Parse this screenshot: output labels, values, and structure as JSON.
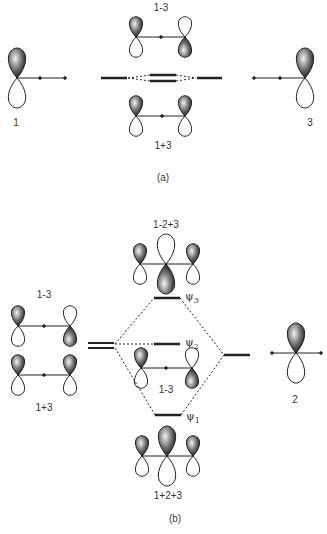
{
  "diagram": {
    "type": "molecular-orbital-interaction",
    "part_a": {
      "caption": "(a)",
      "left_fragment_label": "1",
      "right_fragment_label": "3",
      "upper_combination_label": "1-3",
      "lower_combination_label": "1+3"
    },
    "part_b": {
      "caption": "(b)",
      "left_upper_label": "1-3",
      "left_lower_label": "1+3",
      "right_fragment_label": "2",
      "top_mo_label": "1-2+3",
      "bottom_mo_label": "1+2+3",
      "middle_orbital_label": "1-3",
      "levels": [
        {
          "name": "psi3",
          "symbol": "ψ",
          "subscript": "3"
        },
        {
          "name": "psi2",
          "symbol": "ψ",
          "subscript": "2"
        },
        {
          "name": "psi1",
          "symbol": "ψ",
          "subscript": "1"
        }
      ]
    },
    "colors": {
      "line": "#222222",
      "shade": "#333333",
      "text": "#333333"
    }
  }
}
